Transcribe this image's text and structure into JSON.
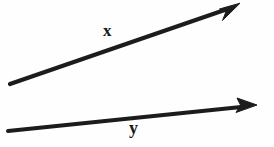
{
  "figure": {
    "background_color": "#fefefe",
    "stroke_color": "#1b1c1e",
    "width": 274,
    "height": 147,
    "labels": {
      "x": "x",
      "y": "y"
    },
    "arrows": [
      {
        "name": "vector-x",
        "label": "x",
        "start": [
          10,
          84
        ],
        "end": [
          240,
          4
        ],
        "thickness": 4,
        "arrowhead": "solid-barbed",
        "label_position": [
          103,
          22
        ]
      },
      {
        "name": "vector-y",
        "label": "y",
        "start": [
          8,
          131
        ],
        "end": [
          257,
          105
        ],
        "thickness": 4,
        "arrowhead": "solid-barbed",
        "label_position": [
          129,
          119
        ]
      }
    ]
  }
}
